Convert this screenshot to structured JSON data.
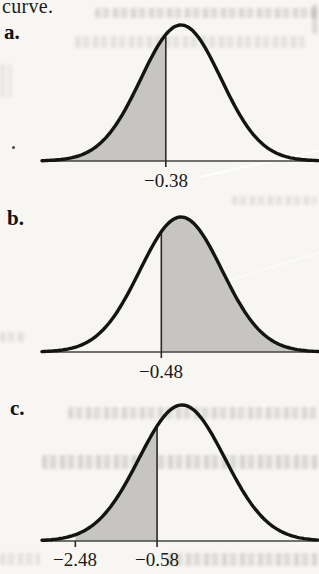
{
  "figure": {
    "caption_fragment": "curve."
  },
  "colors": {
    "paper": "#f7f6f2",
    "curve": "#141414",
    "shade": "#c6c5c2",
    "axis": "#454545",
    "text": "#161616"
  },
  "chart_data": {
    "type": "area",
    "title": "",
    "xlabel": "z",
    "ylabel": "",
    "panels": [
      {
        "label": "a.",
        "shade": "left-tail",
        "shade_from": -3.6,
        "shade_to": -0.38,
        "vlines": [
          -0.38
        ],
        "ticks": [
          -0.38
        ],
        "axis_labels": [
          {
            "text": "−0.38",
            "z": -0.38
          }
        ]
      },
      {
        "label": "b.",
        "shade": "right-tail",
        "shade_from": -0.48,
        "shade_to": 3.6,
        "vlines": [
          -0.48
        ],
        "ticks": [
          -0.48
        ],
        "axis_labels": [
          {
            "text": "−0.48",
            "z": -0.48
          }
        ]
      },
      {
        "label": "c.",
        "shade": "between",
        "shade_from": -2.48,
        "shade_to": -0.58,
        "vlines": [
          -0.58
        ],
        "ticks": [
          -2.48,
          -0.58
        ],
        "axis_labels": [
          {
            "text": "−2.48",
            "z": -2.48
          },
          {
            "text": "−0.58",
            "z": -0.58
          }
        ]
      }
    ]
  }
}
